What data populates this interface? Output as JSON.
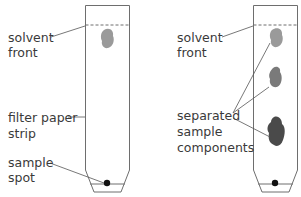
{
  "diagram": {
    "left_strip": {
      "labels": {
        "solvent_front_1": "solvent",
        "solvent_front_2": "front",
        "filter_paper_1": "filter paper",
        "filter_paper_2": "strip",
        "sample_spot_1": "sample",
        "sample_spot_2": "spot"
      }
    },
    "right_strip": {
      "labels": {
        "solvent_front_1": "solvent",
        "solvent_front_2": "front",
        "separated_1": "separated",
        "separated_2": "sample",
        "separated_3": "components"
      }
    },
    "colors": {
      "outline": "#6e6e6e",
      "spot_light": "#9a9a9a",
      "spot_mid": "#7a7a7a",
      "spot_dark": "#4a4a4a",
      "sample_dot": "#111111"
    }
  }
}
